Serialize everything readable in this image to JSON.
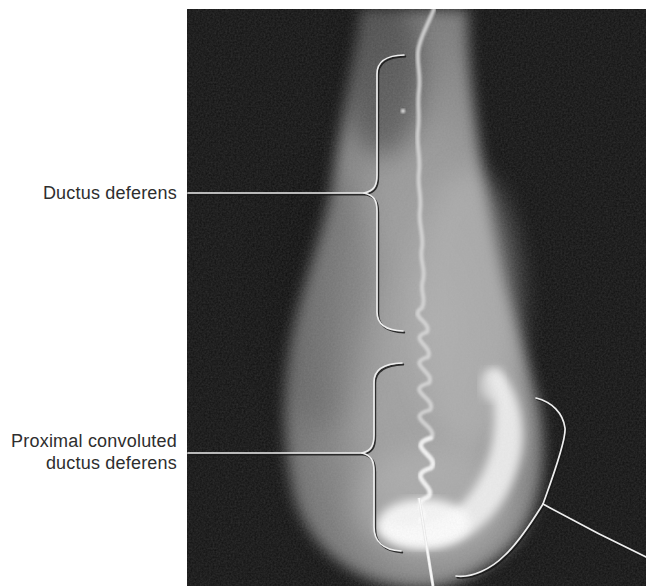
{
  "figure_labels": {
    "ductus_deferens": {
      "text": "Ductus deferens"
    },
    "proximal_convoluted_ductus_deferens": {
      "line1": "Proximal convoluted",
      "line2": "ductus deferens"
    }
  },
  "colors": {
    "page_background": "#ffffff",
    "label_text": "#2e2e2e",
    "photo_background": "#101010",
    "specimen_gray": "#999999",
    "specimen_highlight": "#f2f2f2",
    "duct_line": "#d6d6d6",
    "annotation_line": "#eeeeee",
    "annotation_shadow": "#181818"
  }
}
